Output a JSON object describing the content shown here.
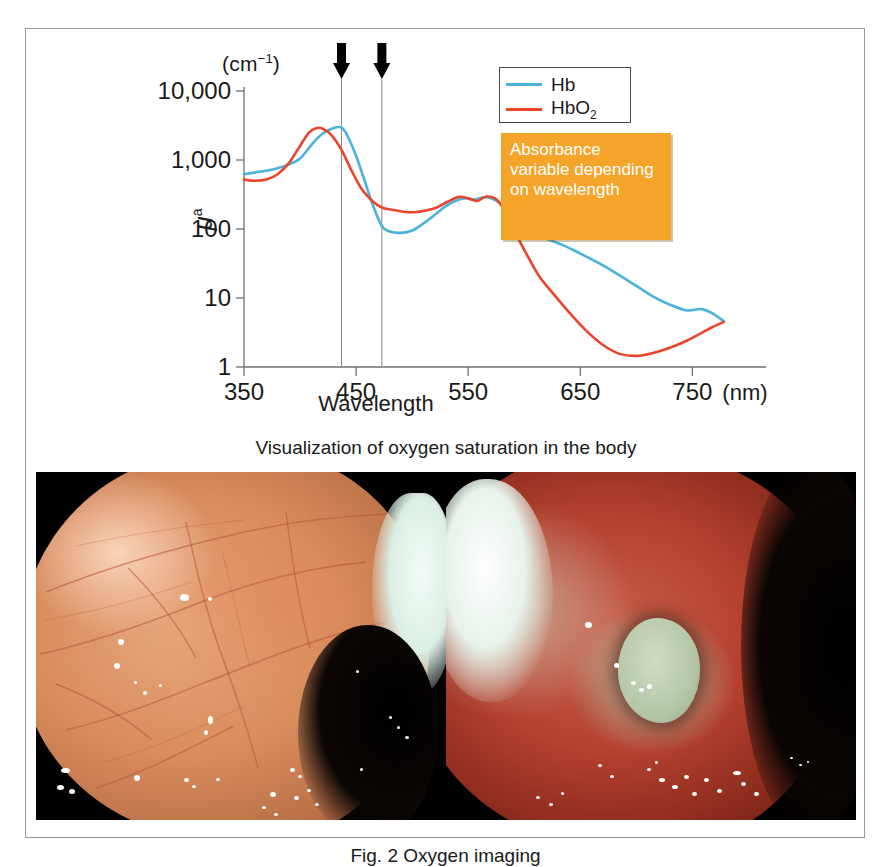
{
  "figure": {
    "caption": "Fig. 2  Oxygen imaging",
    "middle_caption": "Visualization of oxygen saturation in the body"
  },
  "chart_data": {
    "type": "line",
    "title": "",
    "xlabel": "Wavelength",
    "ylabel": "μ",
    "ylabel_sup": "a",
    "y_unit": "(cm",
    "y_unit_sup": "−1",
    "y_unit_close": ")",
    "x_unit": "(nm)",
    "xlim": [
      350,
      780
    ],
    "ylim": [
      1,
      10000
    ],
    "yscale": "log",
    "grid": false,
    "xticks": [
      350,
      450,
      550,
      650,
      750
    ],
    "xticklabels": [
      "350",
      "450",
      "550",
      "650",
      "750"
    ],
    "yticks": [
      1,
      10,
      100,
      1000,
      10000
    ],
    "yticklabels": [
      "1",
      "10",
      "100",
      "1,000",
      "10,000"
    ],
    "legend_position": "top-right",
    "annotations": {
      "arrow_wavelengths": [
        437,
        473
      ],
      "callout_text": "Absorbance variable depending on wavelength",
      "callout_color": "#f5a42a"
    },
    "series": [
      {
        "name": "Hb",
        "color": "#4ab2dd",
        "x": [
          350,
          360,
          370,
          380,
          390,
          400,
          412,
          420,
          430,
          437,
          442,
          450,
          458,
          465,
          473,
          480,
          490,
          500,
          510,
          520,
          530,
          540,
          548,
          556,
          564,
          570,
          578,
          586,
          594,
          600,
          610,
          620,
          635,
          650,
          665,
          680,
          700,
          715,
          730,
          745,
          758,
          768,
          778
        ],
        "values": [
          620,
          660,
          700,
          760,
          860,
          1050,
          1800,
          2400,
          2900,
          2950,
          2300,
          1150,
          480,
          220,
          110,
          92,
          88,
          95,
          120,
          160,
          215,
          260,
          280,
          268,
          288,
          282,
          240,
          180,
          132,
          110,
          86,
          72,
          58,
          44,
          33,
          24,
          15,
          10.5,
          8.0,
          6.6,
          6.9,
          6.0,
          4.6
        ]
      },
      {
        "name": "HbO2",
        "color": "#e8452c",
        "x": [
          350,
          360,
          370,
          380,
          390,
          400,
          408,
          415,
          420,
          428,
          437,
          446,
          455,
          465,
          473,
          482,
          492,
          502,
          512,
          522,
          532,
          542,
          550,
          558,
          566,
          574,
          580,
          588,
          596,
          604,
          614,
          626,
          640,
          655,
          670,
          685,
          700,
          715,
          730,
          745,
          758,
          768,
          778
        ],
        "values": [
          520,
          500,
          520,
          620,
          900,
          1600,
          2500,
          2900,
          2850,
          2300,
          1400,
          700,
          380,
          250,
          205,
          190,
          178,
          175,
          185,
          205,
          250,
          292,
          278,
          255,
          295,
          278,
          215,
          125,
          66,
          38,
          20,
          11.5,
          6.2,
          3.4,
          2.1,
          1.55,
          1.45,
          1.6,
          1.9,
          2.4,
          3.1,
          3.8,
          4.5
        ]
      }
    ]
  },
  "legend": {
    "items": [
      {
        "label": "Hb",
        "sub": "",
        "color": "#4ab2dd"
      },
      {
        "label": "HbO",
        "sub": "2",
        "color": "#e8452c"
      }
    ]
  },
  "photos": [
    {
      "name": "white-light-endoscopy-image",
      "alt": "Endoscopic white light view of mucosa"
    },
    {
      "name": "oxygen-saturation-endoscopy-image",
      "alt": "Oxygen saturation enhanced endoscopic view with greenish lesion"
    }
  ]
}
